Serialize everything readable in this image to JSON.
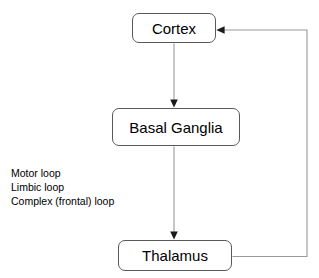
{
  "canvas": {
    "width": 319,
    "height": 278,
    "background": "#ffffff"
  },
  "diagram": {
    "node_border_color": "#595959",
    "node_fill_color": "#ffffff",
    "connector_color": "#9a9a9a",
    "arrowhead_color": "#1a1a1a",
    "text_color": "#000000",
    "nodes": [
      {
        "id": "cortex",
        "label": "Cortex"
      },
      {
        "id": "basal_ganglia",
        "label": "Basal Ganglia"
      },
      {
        "id": "thalamus",
        "label": "Thalamus"
      }
    ],
    "edges": [
      {
        "id": "cortex-to-basal-ganglia",
        "from": "cortex",
        "to": "basal_ganglia",
        "label": "",
        "arrow": "down"
      },
      {
        "id": "basal-ganglia-to-thalamus",
        "from": "basal_ganglia",
        "to": "thalamus",
        "label": "",
        "arrow": "down"
      },
      {
        "id": "thalamus-to-cortex",
        "from": "thalamus",
        "to": "cortex",
        "label": "",
        "arrow": "left"
      }
    ]
  },
  "loops": {
    "items": [
      {
        "label": "Motor loop"
      },
      {
        "label": "Limbic loop"
      },
      {
        "label": "Complex (frontal) loop"
      }
    ]
  }
}
